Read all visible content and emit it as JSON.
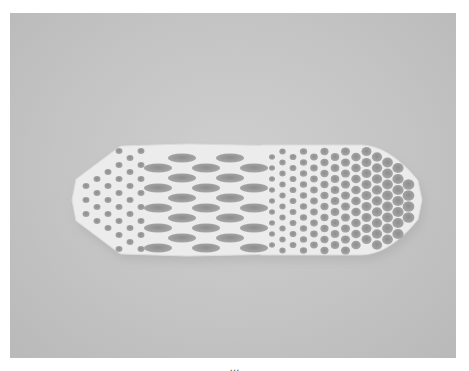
{
  "figure": {
    "caption": "…",
    "colors": {
      "background": "#c6c6c6",
      "lattice": "#ececec",
      "holes": "#9a9a9a",
      "page": "#ffffff"
    }
  }
}
